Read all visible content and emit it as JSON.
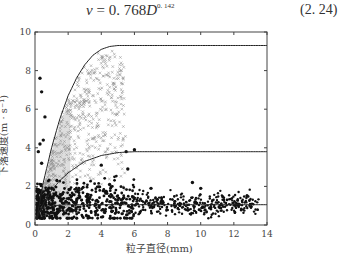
{
  "equation": {
    "lhs": "v",
    "eq": " = 0. 768",
    "var": "D",
    "exponent": "0. 142",
    "number": "(2. 24)"
  },
  "chart_data": {
    "type": "scatter",
    "title": "",
    "xlabel": "粒子直径(mm)",
    "ylabel": "下落速度(m · s⁻¹)",
    "xlim": [
      0,
      14
    ],
    "ylim": [
      0,
      10
    ],
    "xticks": [
      0,
      2,
      4,
      6,
      8,
      10,
      12,
      14
    ],
    "yticks": [
      0,
      2,
      4,
      6,
      8,
      10
    ],
    "grid": false,
    "legend": null,
    "series": [
      {
        "name": "upper fitted curve",
        "kind": "line",
        "color": "#222222",
        "plateau": 9.3,
        "x_plateau": 5.0,
        "start": 0.3,
        "x": [
          0.1,
          0.5,
          1.0,
          1.5,
          2.0,
          2.5,
          3.0,
          3.5,
          4.0,
          4.5,
          5.0,
          6.0,
          8.0,
          10.0,
          12.0,
          14.0
        ],
        "y": [
          0.3,
          2.2,
          4.0,
          5.5,
          6.7,
          7.6,
          8.3,
          8.8,
          9.1,
          9.25,
          9.3,
          9.3,
          9.3,
          9.3,
          9.3,
          9.3
        ]
      },
      {
        "name": "middle fitted curve",
        "kind": "line",
        "color": "#222222",
        "x": [
          0.1,
          0.5,
          1.0,
          1.5,
          2.0,
          2.5,
          3.0,
          4.0,
          5.0,
          6.0,
          8.0,
          10.0,
          12.0,
          14.0
        ],
        "y": [
          0.3,
          1.1,
          1.8,
          2.3,
          2.7,
          3.0,
          3.3,
          3.6,
          3.75,
          3.8,
          3.8,
          3.8,
          3.8,
          3.8
        ]
      },
      {
        "name": "lower fitted line",
        "kind": "line",
        "color": "#222222",
        "x": [
          0.0,
          0.3,
          0.6,
          1.0,
          2.0,
          4.0,
          6.0,
          8.0,
          10.0,
          14.0
        ],
        "y": [
          0.3,
          0.8,
          0.95,
          1.0,
          1.05,
          1.05,
          1.05,
          1.05,
          1.05,
          1.05
        ]
      },
      {
        "name": "raindrops (x markers)",
        "kind": "scatter",
        "marker": "x",
        "color": "#888888",
        "x_range": [
          0.2,
          5.5
        ],
        "y_range": [
          0.5,
          9.5
        ],
        "count": 700
      },
      {
        "name": "graupel/hail (* markers)",
        "kind": "scatter",
        "marker": "*",
        "color": "#111111",
        "x_range": [
          0.1,
          13.5
        ],
        "y_range": [
          0.3,
          2.8
        ],
        "count": 900
      },
      {
        "name": "outliers (* markers)",
        "kind": "scatter",
        "marker": "*",
        "color": "#111111",
        "x": [
          0.3,
          0.4,
          0.6,
          0.5,
          0.3,
          0.2,
          0.4,
          5.5,
          6.0,
          5.6,
          4.0,
          4.5,
          7.0,
          9.5,
          10.0,
          12.8
        ],
        "y": [
          7.6,
          6.9,
          5.6,
          4.4,
          4.2,
          3.8,
          3.2,
          3.8,
          3.9,
          2.9,
          3.1,
          2.1,
          1.9,
          2.2,
          1.9,
          1.5
        ]
      }
    ]
  }
}
